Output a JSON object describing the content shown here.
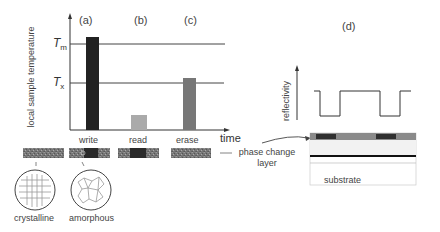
{
  "panels": {
    "a": "(a)",
    "b": "(b)",
    "c": "(c)",
    "d": "(d)"
  },
  "temperature_chart": {
    "ylabel": "local sample temperature",
    "xlabel": "time",
    "thresholds": [
      {
        "label": "T",
        "sub": "m",
        "name": "melting"
      },
      {
        "label": "T",
        "sub": "x",
        "name": "crystallization"
      }
    ],
    "bars": [
      {
        "label": "write",
        "panel": "(a)",
        "color": "#222222",
        "level": "above Tm"
      },
      {
        "label": "read",
        "panel": "(b)",
        "color": "#aaaaaa",
        "level": "low"
      },
      {
        "label": "erase",
        "panel": "(c)",
        "color": "#777777",
        "level": "slightly above Tx"
      }
    ]
  },
  "phase_change_label": "phase change\nlayer",
  "phase_change_label_line1": "phase change",
  "phase_change_label_line2": "layer",
  "structures": [
    {
      "label": "crystalline"
    },
    {
      "label": "amorphous"
    }
  ],
  "reflectivity_chart": {
    "ylabel": "reflectivity"
  },
  "stack": {
    "substrate_label": "substrate"
  },
  "colors": {
    "bar_write": "#222222",
    "bar_read": "#aaaaaa",
    "bar_erase": "#777777",
    "layer_gray": "#888888",
    "layer_dark": "#333333"
  }
}
